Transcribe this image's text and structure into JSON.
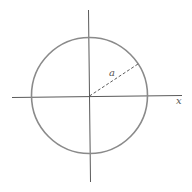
{
  "diagram": {
    "type": "circle-with-axes",
    "labels": {
      "radius": "a",
      "x_axis": "x"
    },
    "colors": {
      "circle": "#8a8a8a",
      "axes": "#5a5a5a",
      "radius": "#4a4a4a",
      "background": "#ffffff"
    },
    "geometry": {
      "center": [
        89.5,
        96
      ],
      "radius": 58
    }
  }
}
